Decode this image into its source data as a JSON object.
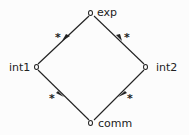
{
  "diagram": {
    "type": "lattice",
    "nodes": [
      {
        "id": "exp",
        "label": "exp"
      },
      {
        "id": "int1",
        "label": "int1"
      },
      {
        "id": "int2",
        "label": "int2"
      },
      {
        "id": "comm",
        "label": "comm"
      }
    ],
    "edges": [
      {
        "from": "exp",
        "to": "int1",
        "label": "*"
      },
      {
        "from": "exp",
        "to": "int2",
        "label": "*"
      },
      {
        "from": "int1",
        "to": "comm",
        "label": "*"
      },
      {
        "from": "int2",
        "to": "comm",
        "label": "*"
      }
    ]
  },
  "colors": {
    "line": "#222222",
    "background": "#fcfcfc"
  }
}
